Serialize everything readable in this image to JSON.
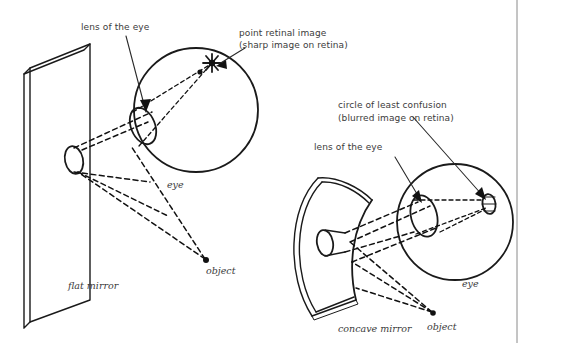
{
  "figure": {
    "background_color": "#ffffff",
    "ink_color": "#1a1a1a",
    "label_color": "#3b3b3b"
  },
  "labels": {
    "lens_left": "lens of the eye",
    "point_retinal_image_l1": "point retinal image",
    "point_retinal_image_l2": "(sharp image on retina)",
    "eye_left": "eye",
    "flat_mirror": "flat mirror",
    "object_left": "object",
    "circle_least_confusion_l1": "circle of least confusion",
    "circle_least_confusion_l2": "(blurred image on retina)",
    "lens_right": "lens of the eye",
    "eye_right": "eye",
    "concave_mirror": "concave mirror",
    "object_right": "object"
  },
  "diagram_left": {
    "name": "flat-mirror-diagram",
    "mirror_type": "flat",
    "image_quality": "sharp",
    "parts": [
      "flat mirror",
      "virtual image",
      "eye",
      "lens of the eye",
      "point retinal image",
      "object"
    ]
  },
  "diagram_right": {
    "name": "concave-mirror-diagram",
    "mirror_type": "concave",
    "image_quality": "blurred",
    "parts": [
      "concave mirror",
      "virtual image",
      "eye",
      "lens of the eye",
      "circle of least confusion",
      "object"
    ]
  }
}
